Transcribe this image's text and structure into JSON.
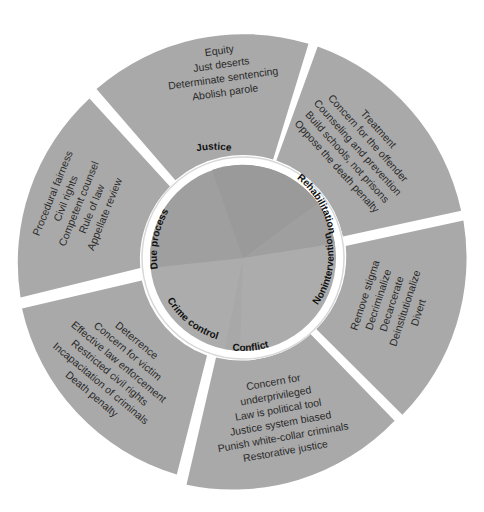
{
  "diagram": {
    "type": "concentric-wheel",
    "center": [
      243,
      258
    ],
    "outer_radius": 224,
    "ring_inner_radius": 103,
    "core_radius": 93,
    "colors": {
      "background": "#ffffff",
      "outer_segment": "#a9a9a9",
      "segment_shadow": "#d4d4d4",
      "gap": "#ffffff",
      "core_upper": "#9f9f9f",
      "core_lower": "#acacac",
      "text": "#2a2a2a",
      "core_text": "#111111"
    },
    "segments": [
      {
        "id": "justice",
        "core_label": "Justice",
        "start_angle": -131,
        "end_angle": -73,
        "items": [
          "Equity",
          "Just deserts",
          "Determinate sentencing",
          "Abolish parole"
        ]
      },
      {
        "id": "rehabilitation",
        "core_label": "Rehabilitation",
        "start_angle": -73,
        "end_angle": -12,
        "items": [
          "Treatment",
          "Concern for the offender",
          "Counseling and prevention",
          "Build schools, not prisons",
          "Oppose the death penalty"
        ]
      },
      {
        "id": "nonintervention",
        "core_label": "Nonintervention",
        "start_angle": -12,
        "end_angle": 46,
        "items": [
          "Remove stigma",
          "Decriminalize",
          "Decarcerate",
          "Deinstitutionalize",
          "Divert"
        ]
      },
      {
        "id": "conflict",
        "core_label": "Conflict",
        "start_angle": 46,
        "end_angle": 107,
        "items": [
          "Concern for",
          "underprivileged",
          "Law is political tool",
          "Justice system biased",
          "Punish white-collar criminals",
          "Restorative justice"
        ]
      },
      {
        "id": "crime-control",
        "core_label": "Crime control",
        "start_angle": 107,
        "end_angle": 168,
        "items": [
          "Deterrence",
          "Concern for victim",
          "Effective law enforcement",
          "Restricted civil rights",
          "Incapacitation of criminals",
          "Death penalty"
        ]
      },
      {
        "id": "due-process",
        "core_label": "Due process",
        "start_angle": 168,
        "end_angle": 229,
        "items": [
          "Procedural fairness",
          "Civil rights",
          "Competent counsel",
          "Rule of law",
          "Appellate review"
        ]
      }
    ]
  }
}
